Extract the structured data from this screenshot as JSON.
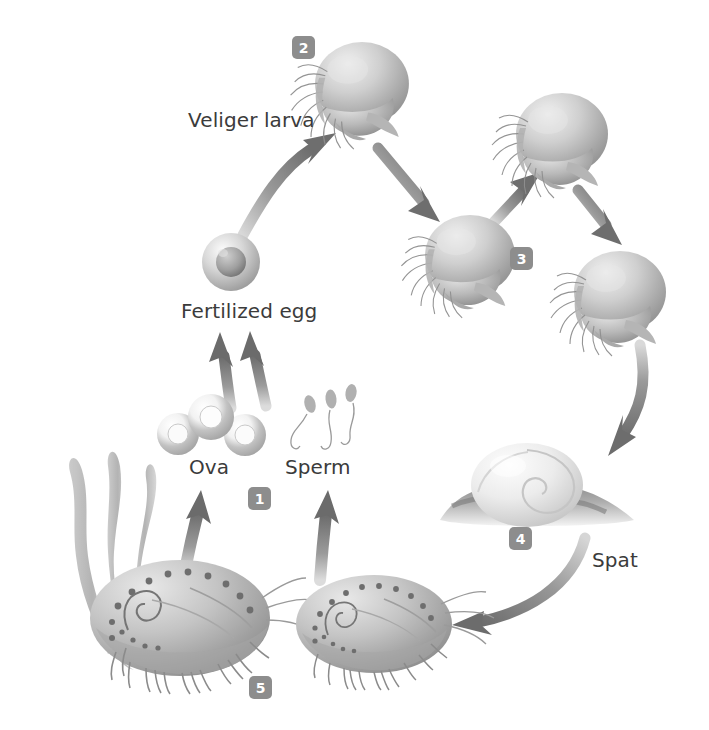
{
  "figure": {
    "background_color": "#ffffff",
    "label_color": "#3b3b3b",
    "badge_color": "#8d8d8d",
    "badge_text_color": "#ffffff",
    "arrow_color": "#7c7c7c",
    "footnote": ""
  },
  "labels": [
    {
      "id": "veliger-larva",
      "text": "Veliger larva",
      "x": 188,
      "y": 108
    },
    {
      "id": "fertilized-egg",
      "text": "Fertilized egg",
      "x": 181,
      "y": 299
    },
    {
      "id": "ova",
      "text": "Ova",
      "x": 189,
      "y": 455
    },
    {
      "id": "sperm",
      "text": "Sperm",
      "x": 285,
      "y": 455
    },
    {
      "id": "spat",
      "text": "Spat",
      "x": 592,
      "y": 548
    }
  ],
  "badges": [
    {
      "id": "stage-1",
      "number": "1",
      "x": 248,
      "y": 487,
      "stage": "Ova and sperm released by adults"
    },
    {
      "id": "stage-2",
      "number": "2",
      "x": 292,
      "y": 36,
      "stage": "Veliger larva"
    },
    {
      "id": "stage-3",
      "number": "3",
      "x": 510,
      "y": 247,
      "stage": "Later larval stages"
    },
    {
      "id": "stage-4",
      "number": "4",
      "x": 509,
      "y": 527,
      "stage": "Spat settled on rock"
    },
    {
      "id": "stage-5",
      "number": "5",
      "x": 249,
      "y": 676,
      "stage": "Adult abalone"
    }
  ],
  "organisms": [
    {
      "id": "fertilized-egg-cell",
      "type": "egg",
      "cx": 231,
      "cy": 262,
      "r": 29
    },
    {
      "id": "ova-cluster",
      "type": "ova",
      "count": 3,
      "cx": 205,
      "cy": 426
    },
    {
      "id": "sperm-cluster",
      "type": "sperm",
      "count": 3,
      "cx": 325,
      "cy": 415
    },
    {
      "id": "veliger-larva-1",
      "type": "veliger",
      "cx": 360,
      "cy": 90,
      "scale": 1.0
    },
    {
      "id": "veliger-larva-2",
      "type": "veliger",
      "cx": 470,
      "cy": 262,
      "scale": 0.95
    },
    {
      "id": "veliger-larva-3",
      "type": "veliger",
      "cx": 560,
      "cy": 140,
      "scale": 1.0
    },
    {
      "id": "veliger-larva-4",
      "type": "veliger",
      "cx": 618,
      "cy": 300,
      "scale": 1.0
    },
    {
      "id": "spat-shell",
      "type": "spat",
      "cx": 527,
      "cy": 484
    },
    {
      "id": "adult-abalone-left",
      "type": "adult",
      "cx": 180,
      "cy": 620,
      "scale": 1.0
    },
    {
      "id": "adult-abalone-right",
      "type": "adult",
      "cx": 374,
      "cy": 625,
      "scale": 0.86
    },
    {
      "id": "kelp-fronds",
      "type": "kelp",
      "count": 3,
      "cx": 95,
      "cy": 560
    }
  ],
  "arrows": [
    {
      "id": "arrow-egg-to-veliger",
      "from": "fertilized-egg",
      "to": "veliger-larva-1",
      "style": "curved"
    },
    {
      "id": "arrow-veliger1-to-veliger2",
      "from": "veliger-larva-1",
      "to": "veliger-larva-2",
      "style": "straight"
    },
    {
      "id": "arrow-veliger2-to-veliger3",
      "from": "veliger-larva-2",
      "to": "veliger-larva-3",
      "style": "straight"
    },
    {
      "id": "arrow-veliger3-to-veliger4",
      "from": "veliger-larva-3",
      "to": "veliger-larva-4",
      "style": "straight"
    },
    {
      "id": "arrow-veliger4-to-spat",
      "from": "veliger-larva-4",
      "to": "spat-shell",
      "style": "curved"
    },
    {
      "id": "arrow-spat-to-adult",
      "from": "spat-shell",
      "to": "adult-abalone-right",
      "style": "curved"
    },
    {
      "id": "arrow-adult-to-ova",
      "from": "adult-abalone-left",
      "to": "ova-cluster",
      "style": "straight"
    },
    {
      "id": "arrow-adult-to-sperm",
      "from": "adult-abalone-right",
      "to": "sperm-cluster",
      "style": "straight"
    },
    {
      "id": "arrow-ova-to-egg",
      "from": "ova-cluster",
      "to": "fertilized-egg-cell",
      "style": "straight"
    },
    {
      "id": "arrow-sperm-to-egg",
      "from": "sperm-cluster",
      "to": "fertilized-egg-cell",
      "style": "straight"
    }
  ]
}
